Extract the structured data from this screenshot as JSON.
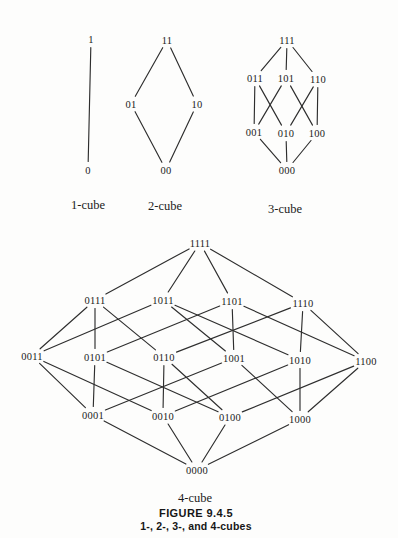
{
  "page": {
    "background_color": "#fdfdfc",
    "ink_color": "#2e2e2e",
    "text_color": "#1b1b1b"
  },
  "caption": {
    "figure_label": "FIGURE 9.4.5",
    "figure_title": "1-, 2-, 3-, and 4-cubes"
  },
  "graphs": [
    {
      "name": "1-cube",
      "label": "1-cube",
      "label_x": 88,
      "label_y": 205,
      "nodes": [
        {
          "label": "1",
          "x": 91,
          "y": 39
        },
        {
          "label": "0",
          "x": 88,
          "y": 170
        }
      ],
      "edges": [
        [
          "1",
          "0"
        ]
      ]
    },
    {
      "name": "2-cube",
      "label": "2-cube",
      "label_x": 165,
      "label_y": 206,
      "nodes": [
        {
          "label": "11",
          "x": 167,
          "y": 40
        },
        {
          "label": "01",
          "x": 131,
          "y": 104
        },
        {
          "label": "10",
          "x": 197,
          "y": 104
        },
        {
          "label": "00",
          "x": 166,
          "y": 170
        }
      ],
      "edges": [
        [
          "11",
          "01"
        ],
        [
          "11",
          "10"
        ],
        [
          "01",
          "00"
        ],
        [
          "10",
          "00"
        ]
      ]
    },
    {
      "name": "3-cube",
      "label": "3-cube",
      "label_x": 285,
      "label_y": 209,
      "nodes": [
        {
          "label": "111",
          "x": 287,
          "y": 40
        },
        {
          "label": "011",
          "x": 255,
          "y": 78
        },
        {
          "label": "101",
          "x": 286,
          "y": 78
        },
        {
          "label": "110",
          "x": 318,
          "y": 79
        },
        {
          "label": "001",
          "x": 254,
          "y": 132
        },
        {
          "label": "010",
          "x": 286,
          "y": 133
        },
        {
          "label": "100",
          "x": 317,
          "y": 133
        },
        {
          "label": "000",
          "x": 287,
          "y": 170
        }
      ],
      "edges": [
        [
          "111",
          "011"
        ],
        [
          "111",
          "101"
        ],
        [
          "111",
          "110"
        ],
        [
          "011",
          "001"
        ],
        [
          "011",
          "010"
        ],
        [
          "101",
          "001"
        ],
        [
          "101",
          "100"
        ],
        [
          "110",
          "010"
        ],
        [
          "110",
          "100"
        ],
        [
          "001",
          "000"
        ],
        [
          "010",
          "000"
        ],
        [
          "100",
          "000"
        ]
      ]
    },
    {
      "name": "4-cube",
      "label": "4-cube",
      "label_x": 195,
      "label_y": 498,
      "nodes": [
        {
          "label": "1111",
          "x": 200,
          "y": 243
        },
        {
          "label": "0111",
          "x": 95,
          "y": 300
        },
        {
          "label": "1011",
          "x": 163,
          "y": 300
        },
        {
          "label": "1101",
          "x": 232,
          "y": 301
        },
        {
          "label": "1110",
          "x": 303,
          "y": 303
        },
        {
          "label": "0011",
          "x": 32,
          "y": 356
        },
        {
          "label": "0101",
          "x": 95,
          "y": 357
        },
        {
          "label": "0110",
          "x": 164,
          "y": 357
        },
        {
          "label": "1001",
          "x": 234,
          "y": 358
        },
        {
          "label": "1010",
          "x": 300,
          "y": 360
        },
        {
          "label": "1100",
          "x": 366,
          "y": 361
        },
        {
          "label": "0001",
          "x": 93,
          "y": 415
        },
        {
          "label": "0010",
          "x": 163,
          "y": 416
        },
        {
          "label": "0100",
          "x": 230,
          "y": 417
        },
        {
          "label": "1000",
          "x": 300,
          "y": 419
        },
        {
          "label": "0000",
          "x": 197,
          "y": 470
        }
      ],
      "edges": [
        [
          "1111",
          "0111"
        ],
        [
          "1111",
          "1011"
        ],
        [
          "1111",
          "1101"
        ],
        [
          "1111",
          "1110"
        ],
        [
          "0111",
          "0011"
        ],
        [
          "0111",
          "0101"
        ],
        [
          "0111",
          "0110"
        ],
        [
          "1011",
          "0011"
        ],
        [
          "1011",
          "1001"
        ],
        [
          "1011",
          "1010"
        ],
        [
          "1101",
          "0101"
        ],
        [
          "1101",
          "1001"
        ],
        [
          "1101",
          "1100"
        ],
        [
          "1110",
          "0110"
        ],
        [
          "1110",
          "1010"
        ],
        [
          "1110",
          "1100"
        ],
        [
          "0011",
          "0001"
        ],
        [
          "0011",
          "0010"
        ],
        [
          "0101",
          "0001"
        ],
        [
          "0101",
          "0100"
        ],
        [
          "0110",
          "0010"
        ],
        [
          "0110",
          "0100"
        ],
        [
          "1001",
          "0001"
        ],
        [
          "1001",
          "1000"
        ],
        [
          "1010",
          "0010"
        ],
        [
          "1010",
          "1000"
        ],
        [
          "1100",
          "0100"
        ],
        [
          "1100",
          "1000"
        ],
        [
          "0001",
          "0000"
        ],
        [
          "0010",
          "0000"
        ],
        [
          "0100",
          "0000"
        ],
        [
          "1000",
          "0000"
        ]
      ]
    }
  ]
}
